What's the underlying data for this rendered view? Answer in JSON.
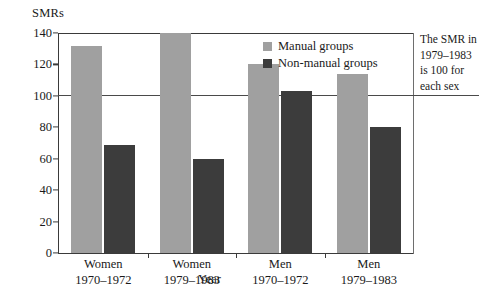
{
  "chart_data": {
    "type": "bar",
    "title": "",
    "subtitle": "",
    "ylabel": "SMRs",
    "xlabel": "Year",
    "ylim": [
      0,
      140
    ],
    "yticks": [
      0,
      20,
      40,
      60,
      80,
      100,
      120,
      140
    ],
    "ytick_labels": [
      "0",
      "20",
      "40",
      "60",
      "80",
      "100",
      "120",
      "140"
    ],
    "grid": false,
    "legend_position": "top-right",
    "categories": [
      "Women 1970–1972",
      "Women 1979–1983",
      "Men 1970–1972",
      "Men 1979–1983"
    ],
    "category_lines": [
      {
        "line1": "Women",
        "line2": "1970–1972"
      },
      {
        "line1": "Women",
        "line2": "1979–1983"
      },
      {
        "line1": "Men",
        "line2": "1970–1972"
      },
      {
        "line1": "Men",
        "line2": "1979–1983"
      }
    ],
    "series": [
      {
        "name": "Manual groups",
        "color": "#a0a0a0",
        "values": [
          132,
          145,
          120,
          114
        ],
        "clipped": [
          false,
          true,
          false,
          false
        ]
      },
      {
        "name": "Non-manual groups",
        "color": "#3c3c3c",
        "values": [
          69,
          60,
          103,
          80
        ],
        "clipped": [
          false,
          false,
          false,
          false
        ]
      }
    ],
    "reference_line": {
      "value": 100,
      "label": "SMR = 100"
    },
    "annotation": {
      "lines": [
        "The SMR in",
        "1979–1983",
        "is 100 for",
        "each sex"
      ]
    }
  },
  "axes": {
    "y_title": "SMRs",
    "x_title": "Year"
  },
  "legend": {
    "items": [
      {
        "label": "Manual groups",
        "color": "#a0a0a0"
      },
      {
        "label": "Non-manual groups",
        "color": "#3c3c3c"
      }
    ]
  },
  "colors": {
    "manual": "#a0a0a0",
    "non_manual": "#3c3c3c",
    "axis": "#3a3a3a",
    "reference_line": "#4a4a4a",
    "background": "#ffffff"
  }
}
